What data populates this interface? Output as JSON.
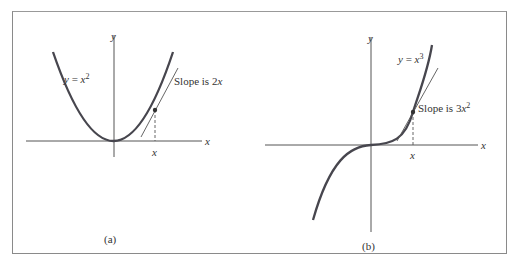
{
  "figure": {
    "panels": [
      {
        "id": "a",
        "caption": "(a)",
        "axis_x_label": "x",
        "axis_y_label": "y",
        "curve_label_lhs": "y",
        "curve_label_eq": " = ",
        "curve_label_base": "x",
        "curve_label_exp": "2",
        "tangent_label_prefix": "Slope is 2",
        "tangent_label_var": "x",
        "tick_label": "x"
      },
      {
        "id": "b",
        "caption": "(b)",
        "axis_x_label": "x",
        "axis_y_label": "y",
        "curve_label_lhs": "y",
        "curve_label_eq": " = ",
        "curve_label_base": "x",
        "curve_label_exp": "3",
        "tangent_label_prefix": "Slope is 3",
        "tangent_label_var": "x",
        "tangent_label_exp": "2",
        "tick_label": "x"
      }
    ],
    "colors": {
      "curve": "#47464e",
      "axis": "#555555",
      "frame": "#8a8a8a"
    }
  }
}
